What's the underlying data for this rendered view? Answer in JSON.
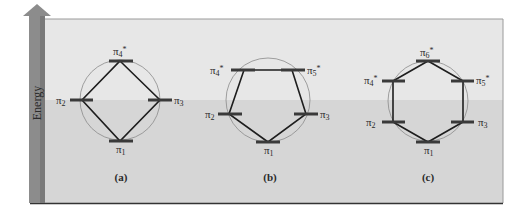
{
  "axis": {
    "label": "Energy",
    "arrow_color": "#8c8c8c",
    "direction": "up"
  },
  "frame": {
    "top_bg": "#e7e7e7",
    "bottom_bg": "#d6d6d6",
    "border_color": "#555555",
    "nonbonding_line_y": 100
  },
  "colors": {
    "level_bar": "#3a3a3a",
    "polygon": "#1e1e1e",
    "circle": "#8a8a8a"
  },
  "panels": [
    {
      "id": "a",
      "label": "(a)",
      "shape": "square",
      "levels": [
        {
          "name": "π",
          "sub": "1",
          "star": false,
          "pos": "bottom"
        },
        {
          "name": "π",
          "sub": "2",
          "star": false,
          "pos": "left"
        },
        {
          "name": "π",
          "sub": "3",
          "star": false,
          "pos": "right"
        },
        {
          "name": "π",
          "sub": "4",
          "star": true,
          "pos": "top"
        }
      ]
    },
    {
      "id": "b",
      "label": "(b)",
      "shape": "pentagon",
      "levels": [
        {
          "name": "π",
          "sub": "1",
          "star": false,
          "pos": "bottom"
        },
        {
          "name": "π",
          "sub": "2",
          "star": false,
          "pos": "lower-left"
        },
        {
          "name": "π",
          "sub": "3",
          "star": false,
          "pos": "lower-right"
        },
        {
          "name": "π",
          "sub": "4",
          "star": true,
          "pos": "upper-left"
        },
        {
          "name": "π",
          "sub": "5",
          "star": true,
          "pos": "upper-right"
        }
      ]
    },
    {
      "id": "c",
      "label": "(c)",
      "shape": "hexagon",
      "levels": [
        {
          "name": "π",
          "sub": "1",
          "star": false,
          "pos": "bottom"
        },
        {
          "name": "π",
          "sub": "2",
          "star": false,
          "pos": "lower-left"
        },
        {
          "name": "π",
          "sub": "3",
          "star": false,
          "pos": "lower-right"
        },
        {
          "name": "π",
          "sub": "4",
          "star": true,
          "pos": "upper-left"
        },
        {
          "name": "π",
          "sub": "5",
          "star": true,
          "pos": "upper-right"
        },
        {
          "name": "π",
          "sub": "6",
          "star": true,
          "pos": "top"
        }
      ]
    }
  ],
  "text": {
    "star": "*",
    "pi": "π",
    "a1": "1",
    "a2": "2",
    "a3": "3",
    "a4": "4",
    "b1": "1",
    "b2": "2",
    "b3": "3",
    "b4": "4",
    "b5": "5",
    "c1": "1",
    "c2": "2",
    "c3": "3",
    "c4": "4",
    "c5": "5",
    "c6": "6"
  }
}
